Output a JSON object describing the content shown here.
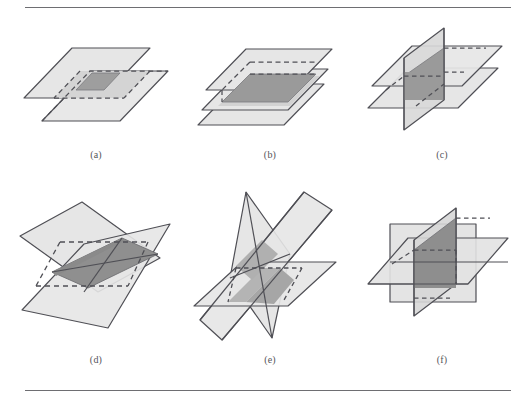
{
  "figure": {
    "kind": "multi-panel-geometry-diagram",
    "background_color": "#ffffff",
    "rules": {
      "stroke_color": "#6e6e72",
      "top_label": "top-horizontal-rule",
      "bottom_label": "bottom-horizontal-rule"
    },
    "style": {
      "outline_color": "#4f4f55",
      "plane_fill_light": "#e2e2e2",
      "plane_fill_mid": "#c9c9c9",
      "plane_fill_dark": "#9a9a9a",
      "plane_fill_darker": "#8c8c8c",
      "dashed_stroke_color": "#4f4f55",
      "caption_color": "#55555a"
    },
    "panels": [
      {
        "id": "a",
        "caption": "(a)",
        "name": "two-offset-parallel-planes",
        "plane_count": 2,
        "description": "Two parallel quadrilateral planes offset diagonally, with a small dark-gray overlap parallelogram at the centre and dashed hidden edges"
      },
      {
        "id": "b",
        "caption": "(b)",
        "name": "three-stacked-parallel-planes",
        "plane_count": 3,
        "description": "Three parallel quadrilateral planes stacked vertically, with a large dark-gray shared overlap region and dashed hidden edges"
      },
      {
        "id": "c",
        "caption": "(c)",
        "name": "two-horizontal-planes-one-vertical",
        "plane_count": 3,
        "description": "Two parallel horizontal planes pierced by one vertical plane, dark-gray intersection band in the middle"
      },
      {
        "id": "d",
        "caption": "(d)",
        "name": "two-tilted-crossing-planes",
        "plane_count": 2,
        "description": "Two large tilted planes crossing in an X, sharing a dark-gray lens-shaped intersection strip, with dashed hidden edges"
      },
      {
        "id": "e",
        "caption": "(e)",
        "name": "three-steeply-tilted-crossing-planes",
        "plane_count": 3,
        "description": "Three steeply inclined planes meeting at a common region, with mid-gray shared faces and a dashed hidden boundary"
      },
      {
        "id": "f",
        "caption": "(f)",
        "name": "three-mutually-perpendicular-planes",
        "plane_count": 3,
        "description": "A frontal square plane, a horizontal plane and a vertical plane meeting mutually at right angles with a dark-gray common core"
      }
    ]
  }
}
